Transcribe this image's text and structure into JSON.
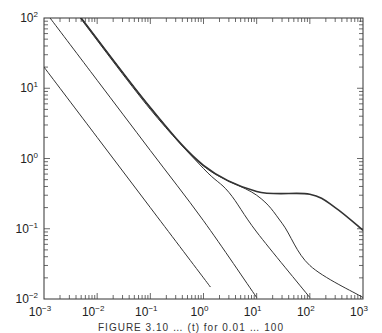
{
  "chart_data": {
    "type": "line",
    "title": "",
    "xlabel": "",
    "ylabel": "",
    "xscale": "log",
    "yscale": "log",
    "xlim": [
      0.001,
      1000
    ],
    "ylim": [
      0.01,
      100
    ],
    "grid": false,
    "legend": null,
    "x_ticks": [
      "10^-3",
      "10^-2",
      "10^-1",
      "10^0",
      "10^1",
      "10^2",
      "10^3"
    ],
    "y_ticks": [
      "10^-2",
      "10^-1",
      "10^0",
      "10^1",
      "10^2"
    ],
    "series": [
      {
        "name": "curve-1",
        "a": 0.02,
        "plateau": 0,
        "cutoff": 1,
        "stroke_width": 1.0,
        "points": [
          [
            0.001,
            20
          ],
          [
            0.01,
            2
          ],
          [
            0.1,
            0.2
          ],
          [
            1,
            0.02
          ],
          [
            1.35,
            0.0148
          ]
        ]
      },
      {
        "name": "curve-2",
        "a": 0.13,
        "plateau": 0.0,
        "cutoff": 1,
        "stroke_width": 1.0,
        "points": [
          [
            0.0013,
            100
          ],
          [
            0.01,
            13
          ],
          [
            0.1,
            1.3
          ],
          [
            1,
            0.13
          ],
          [
            10,
            0.0105
          ]
        ]
      },
      {
        "name": "curve-3",
        "a": 0.48,
        "plateau": 0.3,
        "cutoff": 1,
        "stroke_width": 1.0,
        "points": [
          [
            0.0048,
            100
          ],
          [
            0.1,
            5.0
          ],
          [
            1,
            0.72
          ],
          [
            3,
            0.33
          ],
          [
            10,
            0.09
          ],
          [
            100,
            0.0105
          ]
        ]
      },
      {
        "name": "curve-4",
        "a": 0.5,
        "plateau": 0.32,
        "cutoff": 10,
        "stroke_width": 1.0,
        "points": [
          [
            0.005,
            100
          ],
          [
            0.1,
            5.3
          ],
          [
            1,
            0.78
          ],
          [
            10,
            0.3
          ],
          [
            30,
            0.12
          ],
          [
            100,
            0.03
          ],
          [
            1000,
            0.0105
          ]
        ]
      },
      {
        "name": "curve-5",
        "a": 0.5,
        "plateau": 0.32,
        "cutoff": 150,
        "stroke_width": 1.6,
        "points": [
          [
            0.005,
            100
          ],
          [
            0.1,
            5.3
          ],
          [
            1,
            0.8
          ],
          [
            10,
            0.34
          ],
          [
            100,
            0.31
          ],
          [
            300,
            0.2
          ],
          [
            1000,
            0.095
          ]
        ]
      }
    ]
  },
  "axes": {
    "x_labels": [
      {
        "base": "10",
        "exp": "−3"
      },
      {
        "base": "10",
        "exp": "−2"
      },
      {
        "base": "10",
        "exp": "−1"
      },
      {
        "base": "10",
        "exp": "0"
      },
      {
        "base": "10",
        "exp": "1"
      },
      {
        "base": "10",
        "exp": "2"
      },
      {
        "base": "10",
        "exp": "3"
      }
    ],
    "y_labels": [
      {
        "base": "10",
        "exp": "2"
      },
      {
        "base": "10",
        "exp": "1"
      },
      {
        "base": "10",
        "exp": "0"
      },
      {
        "base": "10",
        "exp": "−1"
      },
      {
        "base": "10",
        "exp": "−2"
      }
    ]
  },
  "caption": "FIGURE 3.10 … (t) for 0.01 … 100"
}
